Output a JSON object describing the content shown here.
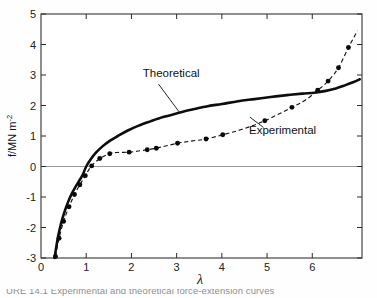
{
  "figure": {
    "caption_partial": "URE 14.1  Experimental and theoretical force-extension curves",
    "y_axis_title_main": "f/MN m",
    "y_axis_title_exponent": "-2",
    "x_axis_title": "λ"
  },
  "annotations": {
    "theoretical_label": "Theoretical",
    "experimental_label": "Experimental"
  },
  "chart_data": {
    "type": "line",
    "title": "",
    "subtitle": "",
    "xlabel": "λ",
    "ylabel": "f/MN m-2",
    "xlim": [
      0,
      7.1
    ],
    "ylim": [
      -3,
      5
    ],
    "xticks": [
      0,
      1,
      2,
      3,
      4,
      5,
      6
    ],
    "xticklabels": [
      "0",
      "1",
      "2",
      "3",
      "4",
      "5",
      "6"
    ],
    "yticks": [
      -3,
      -2,
      -1,
      0,
      1,
      2,
      3,
      4,
      5
    ],
    "yticklabels": [
      "-3",
      "-2",
      "-1",
      "0",
      "1",
      "2",
      "3",
      "4",
      "5"
    ],
    "grid": false,
    "zero_line": true,
    "zero_line_value": 0,
    "legend": "inline-annotations",
    "series": [
      {
        "name": "Theoretical",
        "style": "solid",
        "marker": "none",
        "linewidth": 2.6,
        "color": "#0d0d0d",
        "x": [
          0.3,
          0.34,
          0.38,
          0.43,
          0.48,
          0.54,
          0.6,
          0.67,
          0.75,
          0.84,
          0.92,
          1.0,
          1.1,
          1.22,
          1.36,
          1.52,
          1.7,
          1.92,
          2.16,
          2.42,
          2.7,
          3.0,
          3.32,
          3.66,
          4.0,
          4.36,
          4.72,
          5.08,
          5.44,
          5.78,
          6.05,
          6.3,
          6.52,
          6.72,
          6.9,
          7.05
        ],
        "y": [
          -3.0,
          -2.62,
          -2.28,
          -1.95,
          -1.68,
          -1.4,
          -1.16,
          -0.92,
          -0.7,
          -0.48,
          -0.28,
          0.0,
          0.24,
          0.46,
          0.66,
          0.84,
          1.0,
          1.18,
          1.34,
          1.48,
          1.62,
          1.74,
          1.86,
          1.97,
          2.05,
          2.14,
          2.21,
          2.28,
          2.34,
          2.39,
          2.42,
          2.48,
          2.56,
          2.66,
          2.76,
          2.86
        ]
      },
      {
        "name": "Experimental",
        "style": "dashed",
        "marker": "filled-circle",
        "linewidth": 1.15,
        "color": "#141414",
        "x": [
          0.32,
          0.4,
          0.5,
          0.62,
          0.74,
          0.86,
          0.98,
          1.12,
          1.3,
          1.52,
          1.68,
          1.95,
          2.12,
          2.35,
          2.55,
          3.02,
          3.35,
          3.65,
          4.02,
          4.45,
          4.95,
          5.55,
          5.85,
          6.12,
          6.35,
          6.58,
          6.8,
          7.0
        ],
        "y": [
          -2.95,
          -2.35,
          -1.8,
          -1.32,
          -0.92,
          -0.6,
          -0.3,
          0.02,
          0.26,
          0.42,
          0.46,
          0.47,
          0.5,
          0.55,
          0.6,
          0.76,
          0.84,
          0.9,
          1.04,
          1.22,
          1.5,
          1.94,
          2.18,
          2.5,
          2.8,
          3.24,
          3.9,
          4.45
        ],
        "marker_x": [
          0.32,
          0.4,
          0.5,
          0.62,
          0.74,
          0.86,
          0.98,
          1.12,
          1.3,
          1.52,
          1.95,
          2.35,
          2.55,
          3.02,
          3.65,
          4.02,
          4.95,
          5.55,
          6.12,
          6.35,
          6.58,
          6.8
        ],
        "marker_y": [
          -2.95,
          -2.35,
          -1.8,
          -1.32,
          -0.92,
          -0.6,
          -0.3,
          0.02,
          0.26,
          0.42,
          0.47,
          0.55,
          0.6,
          0.76,
          0.9,
          1.04,
          1.5,
          1.94,
          2.5,
          2.8,
          3.24,
          3.9
        ]
      }
    ],
    "annotations": [
      {
        "text": "Theoretical",
        "text_x": 2.25,
        "text_y": 2.95,
        "leader_from_x": 2.6,
        "leader_from_y": 2.7,
        "leader_to_x": 3.05,
        "leader_to_y": 1.8
      },
      {
        "text": "Experimental",
        "text_x": 4.6,
        "text_y": 1.05,
        "leader_from_x": 4.92,
        "leader_from_y": 1.28,
        "leader_to_x": 4.62,
        "leader_to_y": 1.62
      }
    ]
  }
}
